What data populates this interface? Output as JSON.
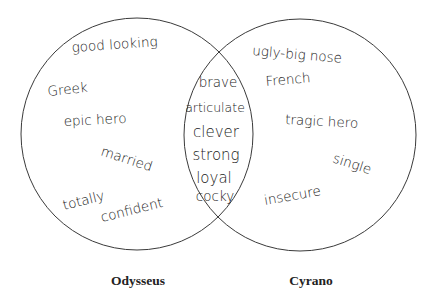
{
  "diagram": {
    "type": "venn",
    "sets": [
      {
        "name": "Odysseus",
        "only": [
          "good looking",
          "Greek",
          "epic hero",
          "married",
          "totally",
          "confident"
        ]
      },
      {
        "name": "Cyrano",
        "only": [
          "ugly-big nose",
          "French",
          "tragic hero",
          "single",
          "insecure"
        ]
      }
    ],
    "shared": [
      "brave",
      "articulate",
      "clever",
      "strong",
      "loyal",
      "cocky"
    ],
    "labels": {
      "left": "Odysseus",
      "right": "Cyrano"
    },
    "left_items": {
      "good_looking": "good looking",
      "greek": "Greek",
      "epic_hero": "epic hero",
      "married": "married",
      "totally": "totally",
      "confident": "confident"
    },
    "right_items": {
      "ugly": "ugly-big nose",
      "french": "French",
      "tragic_hero": "tragic hero",
      "single": "single",
      "insecure": "insecure"
    },
    "shared_items": {
      "brave": "brave",
      "articulate": "articulate",
      "clever": "clever",
      "strong": "strong",
      "loyal": "loyal",
      "cocky": "cocky"
    }
  }
}
